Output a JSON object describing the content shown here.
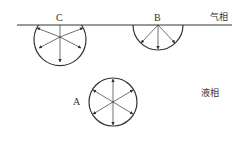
{
  "labels": {
    "bubble_c": "C",
    "bubble_b": "B",
    "bubble_a": "A",
    "gas_phase": "气相",
    "liquid_phase": "液相"
  },
  "colors": {
    "stroke": "#333333",
    "background": "#ffffff"
  }
}
